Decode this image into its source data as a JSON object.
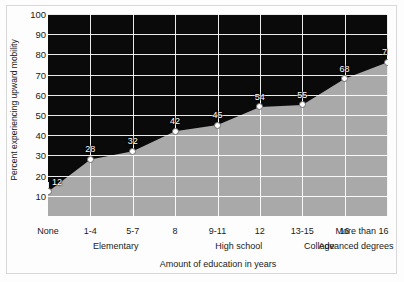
{
  "chart_data": {
    "type": "area",
    "title": "",
    "xlabel": "Amount of education in years",
    "ylabel": "Percent experiencing upward mobility",
    "categories": [
      "None",
      "1-4",
      "5-7",
      "8",
      "9-11",
      "12",
      "13-15",
      "16",
      "More than 16"
    ],
    "values": [
      12,
      28,
      32,
      42,
      45,
      54,
      55,
      68,
      76
    ],
    "data_labels": [
      "12",
      "28",
      "32",
      "42",
      "45",
      "54",
      "55",
      "68",
      "76"
    ],
    "group_labels": [
      {
        "label": "Elementary",
        "center_index": 1.6
      },
      {
        "label": "High school",
        "center_index": 4.5
      },
      {
        "label": "College",
        "center_index": 6.4
      },
      {
        "label": "Advanced degrees",
        "center_index": 7.9
      }
    ],
    "ylim": [
      0,
      100
    ],
    "ytick_values": [
      10,
      20,
      30,
      40,
      50,
      60,
      70,
      80,
      90,
      100
    ],
    "ytick_labels": [
      "10",
      "20",
      "30",
      "40",
      "50",
      "60",
      "70",
      "80",
      "90",
      "100"
    ],
    "grid": true,
    "grid_color": "#ffffff",
    "legend": "none",
    "colors": {
      "plot_background": "#0a0a0a",
      "area_fill": "#a9a9a9",
      "gridline": "#ffffff",
      "marker_fill": "#ffffff",
      "marker_edge": "#6e6e6e",
      "data_label": "#ffffff",
      "axis_text": "#1a1a1a",
      "figure_background": "#fdfdfd",
      "figure_border": "#d8d8d8"
    }
  }
}
